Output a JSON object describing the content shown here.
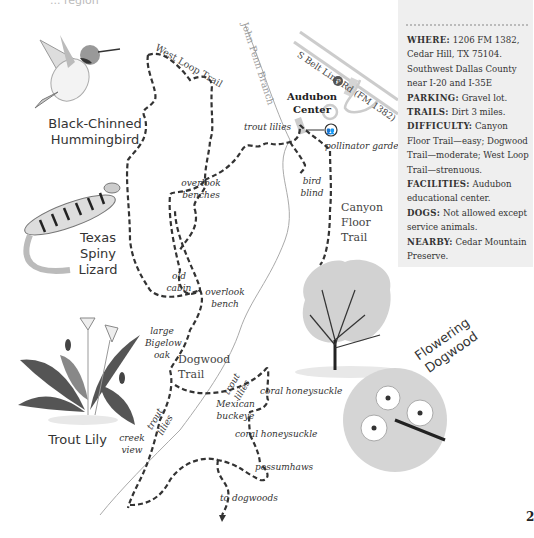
{
  "header": {
    "cut_title": "... region"
  },
  "info_box": {
    "entries": [
      {
        "key": "WHERE:",
        "value": "1206 FM 1382, Cedar Hill, TX 75104. Southwest Dallas County near I-20 and I-35E"
      },
      {
        "key": "PARKING:",
        "value": "Gravel lot."
      },
      {
        "key": "TRAILS:",
        "value": "Dirt 3 miles."
      },
      {
        "key": "DIFFICULTY:",
        "value": "Canyon Floor Trail—easy; Dogwood Trail—moderate; West Loop Trail—strenuous."
      },
      {
        "key": "FACILITIES:",
        "value": "Audubon educational center."
      },
      {
        "key": "DOGS:",
        "value": "Not allowed except service animals."
      },
      {
        "key": "NEARBY:",
        "value": "Cedar Mountain Preserve."
      }
    ]
  },
  "map": {
    "road_label": "S Belt Line Rd (FM 1382)",
    "creek_label": "John Penn Branch",
    "audubon_center": "Audubon Center",
    "parking_symbol": "P",
    "trails": {
      "west_loop": "West Loop Trail",
      "canyon_floor": "Canyon Floor Trail",
      "dogwood": "Dogwood Trail"
    },
    "points": {
      "trout_lilies_1": "trout lilies",
      "pollinator_garden": "pollinator garden",
      "bird_blind": "bird blind",
      "overlook_benches": "overlook benches",
      "old_cabin": "old cabin",
      "overlook_bench": "overlook bench",
      "large_bigelow_oak": "large Bigelow oak",
      "trout_lilies_2": "trout lilies",
      "trout_lilies_3": "trout lilies",
      "coral_honeysuckle_1": "coral honeysuckle",
      "mexican_buckeye": "Mexican buckeye",
      "coral_honeysuckle_2": "coral honeysuckle",
      "creek_view": "creek view",
      "possumhaws": "possumhaws",
      "to_dogwoods": "to dogwoods"
    }
  },
  "illustrations": {
    "hummingbird": "Black-Chinned Hummingbird",
    "lizard": "Texas Spiny Lizard",
    "lily": "Trout Lily",
    "dogwood": "Flowering Dogwood"
  },
  "page_number": "2",
  "colors": {
    "trail": "#333333",
    "road": "#cccccc",
    "infobox_bg": "#efefef",
    "creek": "#aaaaaa"
  }
}
